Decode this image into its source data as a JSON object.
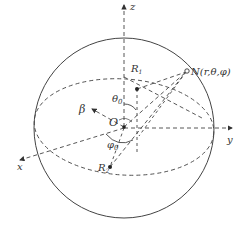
{
  "diagram": {
    "type": "spherical-coordinate-figure",
    "colors": {
      "line": "#444444",
      "text": "#333333",
      "background": "#ffffff"
    },
    "labels": {
      "z_axis": "z",
      "y_axis": "y",
      "x_axis": "x",
      "origin": "O",
      "beta": "β",
      "theta0": "θ",
      "theta0_sub": "0",
      "phi0": "φ",
      "phi0_sub": "0",
      "r1": "R",
      "r1_sub": "1",
      "r2": "R",
      "r2_sub": "2",
      "point_n": "N(r,θ,φ)"
    }
  }
}
